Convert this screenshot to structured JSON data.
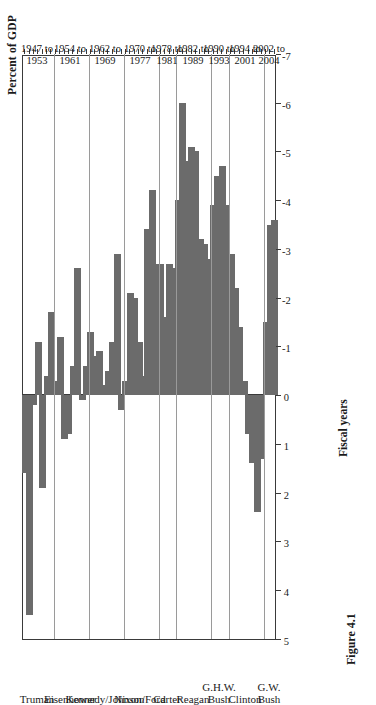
{
  "figure": {
    "caption": "Figure 4.1",
    "value_axis_title": "Percent of GDP",
    "category_axis_title": "Fiscal years"
  },
  "chart_data": {
    "type": "bar",
    "orientation": "horizontal",
    "title": "",
    "xlabel": "Fiscal years",
    "ylabel": "Percent of GDP",
    "ylim": [
      -7,
      5
    ],
    "grid": false,
    "legend": "none",
    "bar_color": "#6b6b6b",
    "value_ticks": [
      "5",
      "4",
      "3",
      "2",
      "1",
      "0",
      "-1",
      "-2",
      "-3",
      "-4",
      "-5",
      "-6",
      "-7"
    ],
    "value_tick_numbers": [
      5,
      4,
      3,
      2,
      1,
      0,
      -1,
      -2,
      -3,
      -4,
      -5,
      -6,
      -7
    ],
    "note": "Federal budget surplus (positive) or deficit (negative) as a percent of GDP, fiscal years 1947-2004, grouped by presidential administration.",
    "groups": [
      {
        "president": "Truman",
        "period_line1": "1947 to",
        "period_line2": "1953",
        "years": [
          1947,
          1948,
          1949,
          1950,
          1951,
          1952,
          1953
        ],
        "values": [
          1.6,
          4.5,
          0.2,
          -1.1,
          1.9,
          -0.4,
          -1.7
        ]
      },
      {
        "president": "Eisenhower",
        "period_line1": "1954 to",
        "period_line2": "1961",
        "years": [
          1954,
          1955,
          1956,
          1957,
          1958,
          1959,
          1960,
          1961
        ],
        "values": [
          -0.3,
          -1.2,
          0.9,
          0.8,
          -0.6,
          -2.6,
          0.1,
          -0.6
        ]
      },
      {
        "president": "Kennedy/Johnson",
        "period_line1": "1962 to",
        "period_line2": "1969",
        "years": [
          1962,
          1963,
          1964,
          1965,
          1966,
          1967,
          1968,
          1969
        ],
        "values": [
          -1.3,
          -0.8,
          -0.9,
          -0.2,
          -0.5,
          -1.1,
          -2.9,
          0.3
        ]
      },
      {
        "president": "Nixon/Ford",
        "period_line1": "1970 to",
        "period_line2": "1977",
        "values": [
          -0.3,
          -2.1,
          -2.0,
          -1.1,
          -0.4,
          -3.4,
          -4.2,
          -2.7
        ],
        "years": [
          1970,
          1971,
          1972,
          1973,
          1974,
          1975,
          1976,
          1977
        ]
      },
      {
        "president": "Carter",
        "period_line1": "1978 to",
        "period_line2": "1981",
        "years": [
          1978,
          1979,
          1980,
          1981
        ],
        "values": [
          -2.7,
          -1.6,
          -2.7,
          -2.6
        ]
      },
      {
        "president": "Reagan",
        "period_line1": "1982 to",
        "period_line2": "1989",
        "years": [
          1982,
          1983,
          1984,
          1985,
          1986,
          1987,
          1988,
          1989
        ],
        "values": [
          -4.0,
          -6.0,
          -4.8,
          -5.1,
          -5.0,
          -3.2,
          -3.1,
          -2.8
        ]
      },
      {
        "president": "G.H.W. Bush",
        "president_line1": "G.H.W.",
        "president_line2": "Bush",
        "period_line1": "1990 to",
        "period_line2": "1993",
        "years": [
          1990,
          1991,
          1992,
          1993
        ],
        "values": [
          -3.9,
          -4.5,
          -4.7,
          -3.9
        ]
      },
      {
        "president": "Clinton",
        "period_line1": "1994 to",
        "period_line2": "2001",
        "years": [
          1994,
          1995,
          1996,
          1997,
          1998,
          1999,
          2000,
          2001
        ],
        "values": [
          -2.9,
          -2.2,
          -1.4,
          -0.3,
          0.8,
          1.4,
          2.4,
          1.3
        ]
      },
      {
        "president": "G.W. Bush",
        "president_line1": "G.W.",
        "president_line2": "Bush",
        "period_line1": "2002 to",
        "period_line2": "2004",
        "years": [
          2002,
          2003,
          2004
        ],
        "values": [
          -1.5,
          -3.5,
          -3.6
        ]
      }
    ]
  }
}
